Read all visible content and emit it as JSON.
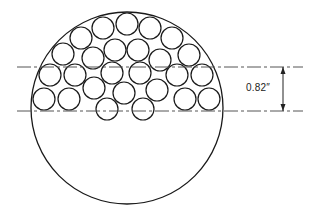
{
  "diagram": {
    "type": "cross-section",
    "outer_circle": {
      "cx": 127,
      "cy": 108,
      "r": 96
    },
    "small_circle_radius": 11,
    "small_circles": [
      {
        "cx": 103,
        "cy": 28
      },
      {
        "cx": 127,
        "cy": 24
      },
      {
        "cx": 150,
        "cy": 28
      },
      {
        "cx": 81,
        "cy": 38
      },
      {
        "cx": 172,
        "cy": 38
      },
      {
        "cx": 63,
        "cy": 54
      },
      {
        "cx": 93,
        "cy": 58
      },
      {
        "cx": 115,
        "cy": 50
      },
      {
        "cx": 138,
        "cy": 50
      },
      {
        "cx": 160,
        "cy": 60
      },
      {
        "cx": 189,
        "cy": 55
      },
      {
        "cx": 50,
        "cy": 75
      },
      {
        "cx": 75,
        "cy": 75
      },
      {
        "cx": 112,
        "cy": 73
      },
      {
        "cx": 140,
        "cy": 73
      },
      {
        "cx": 177,
        "cy": 75
      },
      {
        "cx": 202,
        "cy": 75
      },
      {
        "cx": 44,
        "cy": 99
      },
      {
        "cx": 69,
        "cy": 99
      },
      {
        "cx": 94,
        "cy": 88
      },
      {
        "cx": 124,
        "cy": 93
      },
      {
        "cx": 157,
        "cy": 90
      },
      {
        "cx": 185,
        "cy": 99
      },
      {
        "cx": 209,
        "cy": 99
      },
      {
        "cx": 107,
        "cy": 109
      },
      {
        "cx": 143,
        "cy": 109
      }
    ],
    "reference_lines": {
      "upper_y": 67,
      "lower_y": 111,
      "x_start": 17,
      "x_end": 303
    },
    "dimension": {
      "label": "0.82″",
      "x": 283,
      "from_y": 67,
      "to_y": 111
    }
  }
}
